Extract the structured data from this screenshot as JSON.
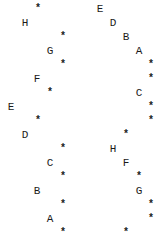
{
  "row_pitch": 14,
  "row_offset": 3,
  "left_tree": {
    "nodes": [
      {
        "row": 0,
        "x": 34,
        "label": "*"
      },
      {
        "row": 1,
        "x": 21,
        "label": "H"
      },
      {
        "row": 2,
        "x": 59,
        "label": "*"
      },
      {
        "row": 3,
        "x": 46,
        "label": "G"
      },
      {
        "row": 4,
        "x": 59,
        "label": "*"
      },
      {
        "row": 5,
        "x": 33,
        "label": "F"
      },
      {
        "row": 6,
        "x": 46,
        "label": "*"
      },
      {
        "row": 7,
        "x": 7,
        "label": "E"
      },
      {
        "row": 8,
        "x": 34,
        "label": "*"
      },
      {
        "row": 9,
        "x": 21,
        "label": "D"
      },
      {
        "row": 10,
        "x": 59,
        "label": "*"
      },
      {
        "row": 11,
        "x": 46,
        "label": "C"
      },
      {
        "row": 12,
        "x": 59,
        "label": "*"
      },
      {
        "row": 13,
        "x": 33,
        "label": "B"
      },
      {
        "row": 14,
        "x": 59,
        "label": "*"
      },
      {
        "row": 15,
        "x": 46,
        "label": "A"
      },
      {
        "row": 16,
        "x": 59,
        "label": "*"
      }
    ]
  },
  "right_tree": {
    "nodes": [
      {
        "row": 0,
        "x": 96,
        "label": "E"
      },
      {
        "row": 1,
        "x": 109,
        "label": "D"
      },
      {
        "row": 2,
        "x": 122,
        "label": "B"
      },
      {
        "row": 3,
        "x": 135,
        "label": "A"
      },
      {
        "row": 4,
        "x": 147,
        "label": "*"
      },
      {
        "row": 5,
        "x": 147,
        "label": "*"
      },
      {
        "row": 6,
        "x": 135,
        "label": "C"
      },
      {
        "row": 7,
        "x": 147,
        "label": "*"
      },
      {
        "row": 8,
        "x": 147,
        "label": "*"
      },
      {
        "row": 9,
        "x": 122,
        "label": "*"
      },
      {
        "row": 10,
        "x": 109,
        "label": "H"
      },
      {
        "row": 11,
        "x": 122,
        "label": "F"
      },
      {
        "row": 12,
        "x": 135,
        "label": "*"
      },
      {
        "row": 13,
        "x": 135,
        "label": "G"
      },
      {
        "row": 14,
        "x": 147,
        "label": "*"
      },
      {
        "row": 15,
        "x": 147,
        "label": "*"
      },
      {
        "row": 16,
        "x": 122,
        "label": "*"
      }
    ]
  }
}
